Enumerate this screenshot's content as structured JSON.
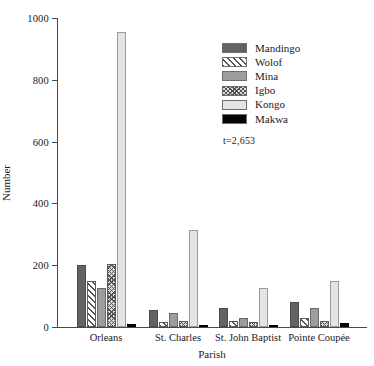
{
  "chart_data": {
    "type": "bar",
    "title": "",
    "xlabel": "Parish",
    "ylabel": "Number",
    "ylim": [
      0,
      1000
    ],
    "yticks": [
      0,
      200,
      400,
      600,
      800,
      1000
    ],
    "grid": false,
    "legend_position": "upper right",
    "annotation": "t=2,653",
    "categories": [
      "Orleans",
      "St. Charles",
      "St. John Baptist",
      "Pointe Coupée"
    ],
    "series": [
      {
        "name": "Mandingo",
        "color": "#636363",
        "pattern": "solid-dark-gray",
        "values": [
          200,
          55,
          60,
          80
        ]
      },
      {
        "name": "Wolof",
        "color": "#ffffff",
        "pattern": "diagonal-hatch",
        "values": [
          148,
          15,
          18,
          28
        ]
      },
      {
        "name": "Mina",
        "color": "#9d9d9d",
        "pattern": "solid-mid-gray",
        "values": [
          125,
          45,
          30,
          60
        ]
      },
      {
        "name": "Igbo",
        "color": "#dcdcdc",
        "pattern": "cross-hatch",
        "values": [
          205,
          18,
          15,
          18
        ]
      },
      {
        "name": "Kongo",
        "color": "#e4e4e4",
        "pattern": "solid-light-gray",
        "values": [
          955,
          315,
          125,
          150
        ]
      },
      {
        "name": "Makwa",
        "color": "#050505",
        "pattern": "solid-black",
        "values": [
          10,
          2,
          6,
          14
        ]
      }
    ]
  },
  "axes": {
    "y_title": "Number",
    "x_title": "Parish",
    "y_tick_labels": [
      "0",
      "200",
      "400",
      "600",
      "800",
      "1000"
    ]
  },
  "legend": {
    "entries": [
      {
        "label": "Mandingo"
      },
      {
        "label": "Wolof"
      },
      {
        "label": "Mina"
      },
      {
        "label": "Igbo"
      },
      {
        "label": "Kongo"
      },
      {
        "label": "Makwa"
      }
    ],
    "note": "t=2,653"
  }
}
